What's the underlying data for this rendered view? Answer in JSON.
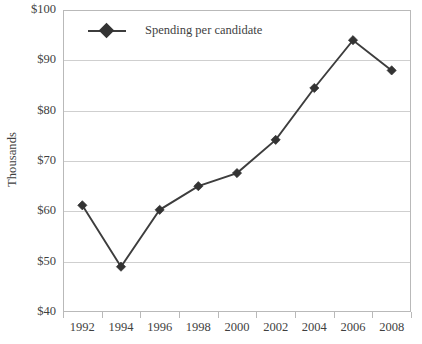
{
  "chart_data": {
    "type": "line",
    "title": "",
    "xlabel": "",
    "ylabel": "Thousands",
    "categories": [
      "1992",
      "1994",
      "1996",
      "1998",
      "2000",
      "2002",
      "2004",
      "2006",
      "2008"
    ],
    "series": [
      {
        "name": "Spending per candidate",
        "values": [
          61.2,
          49.0,
          60.3,
          65.0,
          67.6,
          74.2,
          84.5,
          94.0,
          88.0
        ],
        "color": "#3d3d3d",
        "marker": "diamond"
      }
    ],
    "ylim": [
      40,
      100
    ],
    "y_ticks": [
      100,
      90,
      80,
      70,
      60,
      50,
      40
    ],
    "y_tick_labels": [
      "$100",
      "$90",
      "$80",
      "$70",
      "$60",
      "$50",
      "$40"
    ],
    "grid": "horizontal",
    "legend_position": "top-left-inside",
    "frame": true
  },
  "legend": {
    "entries": [
      {
        "label": "Spending per candidate"
      }
    ]
  },
  "axis": {
    "y_title": "Thousands"
  }
}
